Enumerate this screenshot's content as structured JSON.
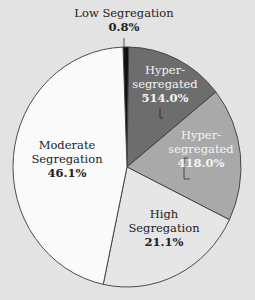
{
  "chart_data": {
    "type": "pie",
    "title": "",
    "start_angle_deg": -2,
    "direction": "clockwise",
    "slices": [
      {
        "label": "Low Segregation",
        "value": 0.8,
        "display": "0.8%",
        "color": "#111111"
      },
      {
        "label": "Hyper-segregated",
        "value": 14.0,
        "display": "514.0%",
        "color": "#6d6d6d"
      },
      {
        "label": "Hyper-segregated",
        "value": 18.0,
        "display": "418.0%",
        "color": "#a9a9a9"
      },
      {
        "label": "High Segregation",
        "value": 21.1,
        "display": "21.1%",
        "color": "#e6e6e6"
      },
      {
        "label": "Moderate Segregation",
        "value": 46.1,
        "display": "46.1%",
        "color": "#fafafa"
      }
    ],
    "categories": [
      "Low Segregation",
      "Hyper-segregated",
      "Hyper-segregated",
      "High Segregation",
      "Moderate Segregation"
    ],
    "values": [
      0.8,
      14.0,
      18.0,
      21.1,
      46.1
    ],
    "legend": "none (direct labels)"
  },
  "labels": {
    "low": {
      "line1": "Low Segregation",
      "pct": "0.8%"
    },
    "hyper1": {
      "line1": "Hyper-",
      "line2": "segregated",
      "pct": "514.0%"
    },
    "hyper2": {
      "line1": "Hyper-",
      "line2": "segregated",
      "pct": "418.0%"
    },
    "high": {
      "line1": "High",
      "line2": "Segregation",
      "pct": "21.1%"
    },
    "moderate": {
      "line1": "Moderate",
      "line2": "Segregation",
      "pct": "46.1%"
    }
  }
}
